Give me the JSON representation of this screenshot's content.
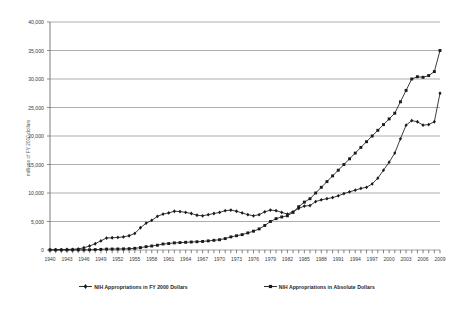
{
  "chart_data": {
    "type": "line",
    "title": "",
    "xlabel": "",
    "ylabel": "millions of FY 2000 dollars",
    "ylim": [
      0,
      40000
    ],
    "ytick_labels": [
      "0",
      "5,000",
      "10,000",
      "15,000",
      "20,000",
      "25,000",
      "30,000",
      "35,000",
      "40,000"
    ],
    "ytick_values": [
      0,
      5000,
      10000,
      15000,
      20000,
      25000,
      30000,
      35000,
      40000
    ],
    "grid": true,
    "legend_position": "bottom",
    "x": [
      1940,
      1941,
      1942,
      1943,
      1944,
      1945,
      1946,
      1947,
      1948,
      1949,
      1950,
      1951,
      1952,
      1953,
      1954,
      1955,
      1956,
      1957,
      1958,
      1959,
      1960,
      1961,
      1962,
      1963,
      1964,
      1965,
      1966,
      1967,
      1968,
      1969,
      1970,
      1971,
      1972,
      1973,
      1974,
      1975,
      1976,
      1977,
      1978,
      1979,
      1980,
      1981,
      1982,
      1983,
      1984,
      1985,
      1986,
      1987,
      1988,
      1989,
      1990,
      1991,
      1992,
      1993,
      1994,
      1995,
      1996,
      1997,
      1998,
      1999,
      2000,
      2001,
      2002,
      2003,
      2004,
      2005,
      2006,
      2007,
      2008,
      2009
    ],
    "xtick_labels": [
      "1940",
      "1943",
      "1946",
      "1949",
      "1952",
      "1955",
      "1958",
      "1961",
      "1964",
      "1967",
      "1970",
      "1973",
      "1976",
      "1979",
      "1982",
      "1985",
      "1988",
      "1991",
      "1994",
      "1997",
      "2000",
      "2003",
      "2006",
      "2009"
    ],
    "xtick_values": [
      1940,
      1943,
      1946,
      1949,
      1952,
      1955,
      1958,
      1961,
      1964,
      1967,
      1970,
      1973,
      1976,
      1979,
      1982,
      1985,
      1988,
      1991,
      1994,
      1997,
      2000,
      2003,
      2006,
      2009
    ],
    "series": [
      {
        "name": "NIH Appropriations in FY 2000 Dollars",
        "marker": "diamond",
        "color": "#1a1a1a",
        "values": [
          40,
          60,
          70,
          90,
          120,
          180,
          400,
          700,
          1100,
          1600,
          2100,
          2150,
          2200,
          2300,
          2500,
          2900,
          3900,
          4700,
          5200,
          5900,
          6300,
          6500,
          6800,
          6750,
          6600,
          6400,
          6100,
          6000,
          6200,
          6400,
          6600,
          6900,
          7000,
          6800,
          6500,
          6200,
          6000,
          6200,
          6700,
          7000,
          6900,
          6600,
          6300,
          6700,
          7300,
          7700,
          7800,
          8500,
          8800,
          9000,
          9200,
          9500,
          9900,
          10200,
          10500,
          10800,
          11000,
          11600,
          12600,
          14000,
          15400,
          17000,
          19500,
          21900,
          22700,
          22500,
          21900,
          22000,
          22500,
          27500
        ]
      },
      {
        "name": "NIH Appropriations in Absolute Dollars",
        "marker": "square",
        "color": "#1a1a1a",
        "values": [
          0.7,
          1,
          2,
          3,
          5,
          9,
          22,
          40,
          70,
          110,
          160,
          170,
          180,
          200,
          230,
          290,
          420,
          580,
          700,
          840,
          1050,
          1130,
          1250,
          1300,
          1350,
          1400,
          1450,
          1500,
          1600,
          1700,
          1800,
          2000,
          2300,
          2500,
          2700,
          3000,
          3300,
          3700,
          4300,
          5000,
          5500,
          5800,
          6000,
          6600,
          7600,
          8400,
          9000,
          10000,
          11000,
          12000,
          13000,
          14000,
          15000,
          16000,
          17000,
          18000,
          19000,
          20000,
          21000,
          22000,
          23000,
          24000,
          26000,
          28000,
          30000,
          30400,
          30300,
          30600,
          31300,
          35000
        ]
      }
    ]
  }
}
